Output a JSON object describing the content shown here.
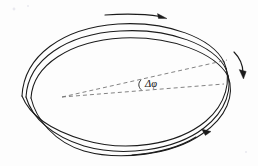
{
  "figure": {
    "name": "precessing-orbit-diagram",
    "background_color": "#fdfdfd",
    "ink_color": "#1b1b1b",
    "guide_color": "#6d6d6d",
    "width": 258,
    "height": 166
  },
  "labels": {
    "precession_angle": "Δφ"
  },
  "annotations": {
    "angle_vertex": "orbit-focus",
    "angle_arc_name": "precession-angle-arc",
    "guide_upper_name": "apsis-line-after-precession",
    "guide_lower_name": "apsis-line-before-precession"
  },
  "arrows": [
    {
      "name": "top-direction-arrow",
      "direction": "right",
      "position": "top"
    },
    {
      "name": "right-direction-arrow",
      "direction": "down-right",
      "position": "right"
    },
    {
      "name": "bottom-direction-arrow",
      "direction": "right",
      "position": "bottom-right"
    }
  ],
  "chart_data": {
    "type": "line",
    "title": "",
    "xlabel": "",
    "ylabel": "",
    "grid": false,
    "legend": null,
    "annotations": [
      {
        "text": "Δφ",
        "x": 150,
        "y": 81,
        "kind": "angle-label"
      }
    ],
    "series": [
      {
        "name": "orbit-turn-1-upper",
        "path": "M 22,96 C 24,56 62,28 118,24 C 168,21 212,38 224,62"
      },
      {
        "name": "orbit-turn-1-lower",
        "path": "M 224,62 C 232,80 226,104 206,121 C 176,146 124,152 84,140 C 50,130 30,116 22,96"
      },
      {
        "name": "orbit-turn-2-upper",
        "path": "M 26,97 C 28,60 66,34 120,31 C 170,28 214,45 226,69"
      },
      {
        "name": "orbit-turn-2-lower",
        "path": "M 226,69 C 234,88 226,111 204,128 C 174,151 122,157 84,146 C 52,136 32,118 26,97"
      },
      {
        "name": "orbit-turn-3-upper",
        "path": "M 31,98 C 33,65 70,41 122,38 C 172,36 215,53 228,76"
      },
      {
        "name": "orbit-turn-3-lower",
        "path": "M 228,76 C 235,95 227,117 202,134 C 172,155 120,161 84,151 C 54,142 36,119 31,98"
      },
      {
        "name": "orbit-tail-open-end",
        "path": "M 196,137 C 180,147 158,153 132,155"
      }
    ],
    "guides": [
      {
        "name": "apsis-line-after-precession",
        "x1": 62,
        "y1": 97,
        "x2": 227,
        "y2": 60
      },
      {
        "name": "apsis-line-before-precession",
        "x1": 62,
        "y1": 97,
        "x2": 224,
        "y2": 84
      }
    ]
  }
}
